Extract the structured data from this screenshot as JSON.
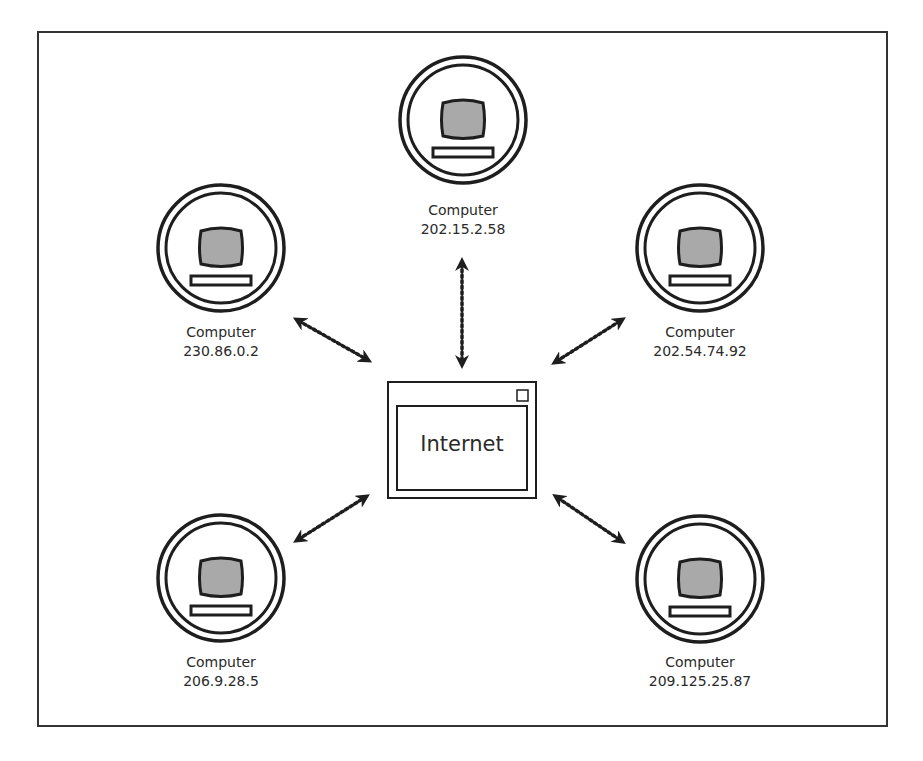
{
  "diagram": {
    "title": "",
    "center": {
      "label": "Internet"
    },
    "nodes": [
      {
        "id": "top",
        "label": "Computer",
        "ip": "202.15.2.58",
        "cx": 463,
        "cy": 120
      },
      {
        "id": "upper-left",
        "label": "Computer",
        "ip": "230.86.0.2",
        "cx": 221,
        "cy": 248
      },
      {
        "id": "upper-right",
        "label": "Computer",
        "ip": "202.54.74.92",
        "cx": 700,
        "cy": 248
      },
      {
        "id": "lower-left",
        "label": "Computer",
        "ip": "206.9.28.5",
        "cx": 221,
        "cy": 578
      },
      {
        "id": "lower-right",
        "label": "Computer",
        "ip": "209.125.25.87",
        "cx": 700,
        "cy": 579
      }
    ],
    "connections": [
      {
        "from": "top",
        "to": "Internet",
        "style": "dotted-double-arrow"
      },
      {
        "from": "upper-left",
        "to": "Internet",
        "style": "dotted-double-arrow"
      },
      {
        "from": "upper-right",
        "to": "Internet",
        "style": "dotted-double-arrow"
      },
      {
        "from": "lower-left",
        "to": "Internet",
        "style": "dotted-double-arrow"
      },
      {
        "from": "lower-right",
        "to": "Internet",
        "style": "dotted-double-arrow"
      }
    ],
    "colors": {
      "stroke": "#1e1e1e",
      "screen_fill": "#a9a9a9",
      "background": "#ffffff"
    }
  }
}
